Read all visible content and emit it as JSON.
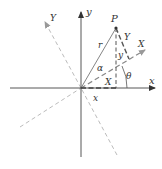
{
  "diagram": {
    "labels": {
      "x_axis": "x",
      "y_axis": "y",
      "X_axis": "X",
      "Y_axis": "Y",
      "point": "P",
      "radius": "r",
      "alpha": "α",
      "theta": "θ",
      "y_segment": "y",
      "Y_segment": "Y",
      "X_segment": "X",
      "x_segment": "x"
    },
    "colors": {
      "axis": "#444444",
      "rotated_axis": "#999999",
      "construction": "#555555",
      "background": "#ffffff"
    },
    "geometry": {
      "origin": [
        81,
        88
      ],
      "point_P": [
        116,
        28
      ],
      "x_axis_end": [
        155,
        88
      ],
      "y_axis_end": [
        81,
        12
      ],
      "X_axis_end": [
        145,
        50
      ],
      "Y_axis_end": [
        45,
        22
      ],
      "X_axis_neg_end": [
        20,
        127
      ],
      "Y_axis_neg_end": [
        117,
        155
      ]
    }
  }
}
